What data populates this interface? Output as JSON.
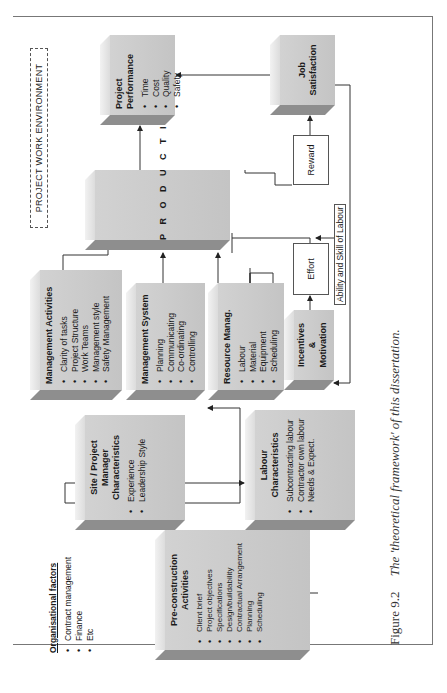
{
  "diagram": {
    "environment_label": "PROJECT WORK ENVIRONMENT",
    "organisational_factors": {
      "title": "Organisational factors",
      "items": [
        "Contract management",
        "Finance",
        "Etc"
      ]
    },
    "pre_construction": {
      "title_line1": "Pre-construction",
      "title_line2": "Activities",
      "items": [
        "Client brief",
        "Project objectives",
        "Specifications",
        "Design/buildability",
        "Contractual Arrangement",
        "Planning",
        "Scheduling"
      ]
    },
    "site_manager": {
      "title_line1": "Site / Project",
      "title_line2": "Manager",
      "title_line3": "Characteristics",
      "items": [
        "Experience",
        "Leadership Style"
      ]
    },
    "labour_characteristics": {
      "title_line1": "Labour",
      "title_line2": "Characteristics",
      "items": [
        "Subcontracting labour",
        "Contractor own labour",
        "Needs & Expect."
      ]
    },
    "management_activities": {
      "title": "Management Activities",
      "items": [
        "Clarity of tasks",
        "Project Structure",
        "Work Teams",
        "Management style",
        "Safety Management"
      ]
    },
    "management_system": {
      "title": "Management System",
      "items": [
        "Planning",
        "Communicating",
        "Co-ordinating",
        "Controlling"
      ]
    },
    "resource_management": {
      "title": "Resource Manag.",
      "items": [
        "Labour",
        "Material",
        "Equipment",
        "Scheduling"
      ]
    },
    "incentives": {
      "title_line1": "Incentives",
      "title_line2": "&",
      "title_line3": "Motivation"
    },
    "productivity": {
      "label": "PRODUCTIVITY"
    },
    "effort": {
      "label": "Effort"
    },
    "reward": {
      "label": "Reward"
    },
    "ability_label": "Ability and Skill of Labour",
    "project_performance": {
      "title_line1": "Project",
      "title_line2": "Performance",
      "items": [
        "Time",
        "Cost",
        "Quality",
        "Safety"
      ]
    },
    "job_satisfaction": {
      "title_line1": "Job",
      "title_line2": "Satisfaction"
    }
  },
  "caption": {
    "figure_number": "Figure 9.2",
    "text": "The 'theoretical framework' of this dissertation."
  }
}
